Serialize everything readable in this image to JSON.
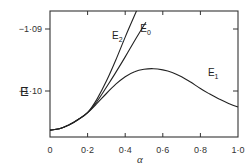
{
  "chart_data": {
    "type": "line",
    "title": "",
    "xlabel": "α",
    "ylabel": "E",
    "xlim": [
      0,
      1.0
    ],
    "ylim": [
      -1.1072,
      -1.0871
    ],
    "grid": false,
    "legend_position": "inline labels",
    "x_ticks": [
      0,
      0.2,
      0.4,
      0.6,
      0.8,
      1.0
    ],
    "x_tick_labels": [
      "0",
      "0·2",
      "0·4",
      "0·6",
      "0·8",
      "1·0"
    ],
    "y_ticks": [
      -1.09,
      -1.1
    ],
    "y_tick_labels": [
      "−1·09",
      "−1·10"
    ],
    "series": [
      {
        "name": "E1",
        "label_main": "E",
        "label_sub": "1",
        "x": [
          0,
          0.05,
          0.1,
          0.15,
          0.2,
          0.25,
          0.3,
          0.35,
          0.4,
          0.45,
          0.5,
          0.55,
          0.6,
          0.65,
          0.7,
          0.75,
          0.8,
          0.85,
          0.9,
          0.95,
          1.0
        ],
        "values": [
          -1.1063,
          -1.1061,
          -1.1055,
          -1.1046,
          -1.1035,
          -1.102,
          -1.1004,
          -1.0989,
          -1.0977,
          -1.0969,
          -1.0965,
          -1.0964,
          -1.0966,
          -1.097,
          -1.0977,
          -1.0986,
          -1.0996,
          -1.1005,
          -1.1013,
          -1.102,
          -1.1026
        ]
      },
      {
        "name": "E0",
        "label_main": "E",
        "label_sub": "0",
        "x": [
          0,
          0.05,
          0.1,
          0.15,
          0.2,
          0.25,
          0.3,
          0.35,
          0.4,
          0.45,
          0.51
        ],
        "values": [
          -1.1063,
          -1.1061,
          -1.1055,
          -1.1046,
          -1.1035,
          -1.1017,
          -1.0994,
          -1.097,
          -1.0945,
          -1.0919,
          -1.0889
        ]
      },
      {
        "name": "E2",
        "label_main": "E",
        "label_sub": "2",
        "x": [
          0,
          0.05,
          0.1,
          0.15,
          0.2,
          0.25,
          0.3,
          0.35,
          0.4,
          0.46
        ],
        "values": [
          -1.1063,
          -1.1061,
          -1.1055,
          -1.1046,
          -1.1035,
          -1.1013,
          -1.0984,
          -1.095,
          -1.0913,
          -1.0871
        ]
      }
    ],
    "annotations": [
      {
        "text": "E2",
        "x": 0.33,
        "y": -1.0916
      },
      {
        "text": "E0",
        "x": 0.48,
        "y": -1.0905
      },
      {
        "text": "E1",
        "x": 0.84,
        "y": -1.0975
      }
    ]
  }
}
